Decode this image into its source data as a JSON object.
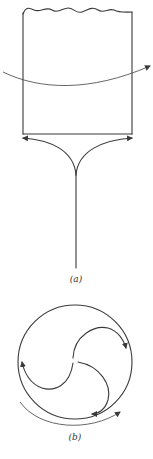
{
  "figure": {
    "panels": [
      {
        "id": "a",
        "label": "(a)"
      },
      {
        "id": "b",
        "label": "(b)"
      }
    ],
    "colors": {
      "ink": "#3a3a3a",
      "background": "#ffffff"
    }
  }
}
